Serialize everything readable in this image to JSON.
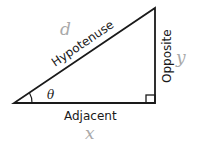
{
  "diagram": {
    "sides": {
      "hypotenuse": {
        "label": "Hypotenuse",
        "variable": "d"
      },
      "opposite": {
        "label": "Opposite",
        "variable": "y"
      },
      "adjacent": {
        "label": "Adjacent",
        "variable": "x"
      }
    },
    "angle": {
      "symbol": "θ"
    },
    "colors": {
      "stroke": "#1a1a1a",
      "variable": "#a9a9a9"
    }
  }
}
